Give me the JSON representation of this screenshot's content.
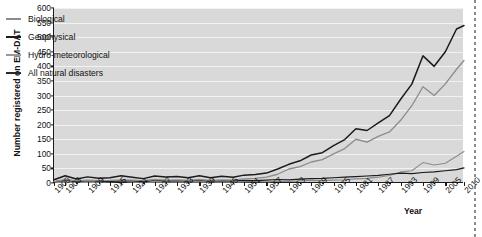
{
  "chart_data": {
    "type": "line",
    "title": "",
    "xlabel": "Year",
    "ylabel": "Number registered on EM-DAT",
    "xlim": [
      1900,
      2010
    ],
    "ylim": [
      0,
      600
    ],
    "ytick_step": 50,
    "yticks": [
      0,
      50,
      100,
      150,
      200,
      250,
      300,
      350,
      400,
      450,
      500,
      550,
      600
    ],
    "xticks": [
      1900,
      1903,
      1909,
      1915,
      1921,
      1927,
      1933,
      1939,
      1945,
      1951,
      1957,
      1963,
      1969,
      1975,
      1981,
      1987,
      1993,
      1999,
      2005,
      2010
    ],
    "grid": "horizontal",
    "legend_position": "upper-left-inside",
    "plot_background": "#d9d9d9",
    "gridline_color": "#f2f2f2",
    "axis_color": "#1b1b1b",
    "series": [
      {
        "name": "Biological",
        "color": "#8c8c8c",
        "x": [
          1900,
          1903,
          1906,
          1909,
          1912,
          1915,
          1918,
          1921,
          1924,
          1927,
          1930,
          1933,
          1936,
          1939,
          1942,
          1945,
          1948,
          1951,
          1954,
          1957,
          1960,
          1963,
          1966,
          1969,
          1972,
          1975,
          1978,
          1981,
          1984,
          1987,
          1990,
          1993,
          1996,
          1999,
          2002,
          2005,
          2008,
          2010
        ],
        "values": [
          2,
          3,
          2,
          3,
          2,
          4,
          6,
          3,
          2,
          3,
          4,
          3,
          3,
          4,
          3,
          4,
          3,
          4,
          5,
          4,
          6,
          5,
          7,
          9,
          8,
          10,
          11,
          14,
          16,
          20,
          26,
          38,
          42,
          70,
          62,
          68,
          92,
          108
        ]
      },
      {
        "name": "Geophysical",
        "color": "#1b1b1b",
        "x": [
          1900,
          1903,
          1906,
          1909,
          1912,
          1915,
          1918,
          1921,
          1924,
          1927,
          1930,
          1933,
          1936,
          1939,
          1942,
          1945,
          1948,
          1951,
          1954,
          1957,
          1960,
          1963,
          1966,
          1969,
          1972,
          1975,
          1978,
          1981,
          1984,
          1987,
          1990,
          1993,
          1996,
          1999,
          2002,
          2005,
          2008,
          2010
        ],
        "values": [
          4,
          10,
          5,
          8,
          6,
          5,
          8,
          7,
          5,
          9,
          7,
          8,
          6,
          9,
          6,
          8,
          7,
          9,
          8,
          10,
          12,
          11,
          13,
          15,
          16,
          18,
          20,
          22,
          24,
          26,
          30,
          34,
          32,
          36,
          38,
          42,
          46,
          52
        ]
      },
      {
        "name": "Hydro-meteorological",
        "color": "#8c8c8c",
        "x": [
          1900,
          1903,
          1906,
          1909,
          1912,
          1915,
          1918,
          1921,
          1924,
          1927,
          1930,
          1933,
          1936,
          1939,
          1942,
          1945,
          1948,
          1951,
          1954,
          1957,
          1960,
          1963,
          1966,
          1969,
          1972,
          1975,
          1978,
          1981,
          1984,
          1987,
          1990,
          1993,
          1996,
          1999,
          2002,
          2005,
          2008,
          2010
        ],
        "values": [
          5,
          12,
          7,
          10,
          8,
          9,
          11,
          10,
          8,
          12,
          10,
          11,
          9,
          12,
          9,
          11,
          10,
          14,
          16,
          20,
          30,
          48,
          56,
          72,
          80,
          100,
          118,
          150,
          140,
          160,
          175,
          215,
          265,
          330,
          300,
          340,
          390,
          420
        ]
      },
      {
        "name": "All natural disasters",
        "color": "#1b1b1b",
        "x": [
          1900,
          1903,
          1906,
          1909,
          1912,
          1915,
          1918,
          1921,
          1924,
          1927,
          1930,
          1933,
          1936,
          1939,
          1942,
          1945,
          1948,
          1951,
          1954,
          1957,
          1960,
          1963,
          1966,
          1969,
          1972,
          1975,
          1978,
          1981,
          1984,
          1987,
          1990,
          1993,
          1996,
          1999,
          2002,
          2005,
          2008,
          2010
        ],
        "values": [
          11,
          25,
          14,
          21,
          16,
          18,
          25,
          20,
          15,
          24,
          21,
          22,
          18,
          25,
          18,
          23,
          20,
          27,
          29,
          34,
          48,
          64,
          76,
          96,
          104,
          128,
          149,
          186,
          180,
          206,
          231,
          287,
          339,
          436,
          400,
          450,
          528,
          540
        ]
      }
    ]
  },
  "legend": {
    "items": [
      {
        "label": "Biological",
        "color": "#8c8c8c"
      },
      {
        "label": "Geophysical",
        "color": "#1b1b1b"
      },
      {
        "label": "Hydro-meteorological",
        "color": "#9a9a9a"
      },
      {
        "label": "All natural disasters",
        "color": "#2a2a2a"
      }
    ]
  }
}
